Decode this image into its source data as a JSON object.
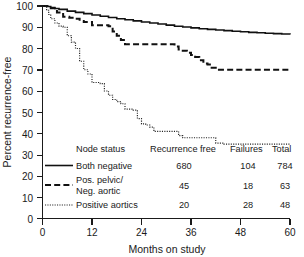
{
  "chart_data": {
    "type": "line",
    "title": "",
    "xlabel": "Months on study",
    "ylabel": "Percent recurrence-free",
    "xlim": [
      0,
      60
    ],
    "ylim": [
      0,
      100
    ],
    "xticks": [
      "0",
      "12",
      "24",
      "36",
      "48",
      "60"
    ],
    "yticks": [
      "0",
      "10",
      "20",
      "30",
      "40",
      "50",
      "60",
      "70",
      "80",
      "90",
      "100"
    ],
    "grid": false,
    "legend_position": "inside-lower-center",
    "series": [
      {
        "name": "Both negative",
        "style": "solid",
        "x": [
          0,
          1,
          2,
          3,
          4,
          6,
          8,
          10,
          12,
          14,
          16,
          18,
          20,
          22,
          24,
          26,
          28,
          30,
          32,
          34,
          36,
          38,
          40,
          42,
          44,
          46,
          48,
          50,
          52,
          54,
          56,
          58,
          60
        ],
        "y": [
          100,
          99.8,
          99.3,
          98.8,
          98.4,
          97.6,
          97.0,
          96.4,
          95.8,
          95.2,
          94.6,
          94.0,
          93.5,
          93.0,
          92.5,
          92.0,
          91.5,
          91.0,
          90.5,
          90.1,
          89.7,
          89.3,
          89.0,
          88.7,
          88.4,
          88.1,
          87.9,
          87.6,
          87.4,
          87.2,
          87.0,
          86.8,
          86.6
        ]
      },
      {
        "name": "Pos. pelvic/ Neg. aortic",
        "style": "dashed",
        "x": [
          0,
          1,
          2,
          3.5,
          5,
          6.5,
          8,
          9,
          10,
          12,
          14,
          16,
          17,
          18,
          19,
          20,
          22,
          24,
          30,
          32,
          33,
          34,
          35,
          36,
          37,
          38,
          39,
          40,
          41,
          42,
          60
        ],
        "y": [
          100,
          100,
          99,
          97,
          95,
          94.5,
          94,
          93,
          92.5,
          91,
          91,
          90.5,
          88,
          86,
          84,
          82,
          82,
          82,
          82,
          81,
          79.5,
          79,
          78,
          77,
          76,
          74.5,
          73,
          72.5,
          71,
          70,
          70
        ]
      },
      {
        "name": "Positive aortics",
        "style": "dotted",
        "x": [
          0,
          1,
          1.5,
          2,
          3,
          4,
          5,
          6,
          7,
          8,
          9,
          10,
          11,
          12,
          14,
          15,
          16,
          17,
          18,
          19,
          20,
          22,
          23,
          24,
          25,
          26,
          27,
          32,
          33,
          34,
          40,
          42,
          44,
          60
        ],
        "y": [
          100,
          98,
          96,
          94,
          92,
          90.5,
          90,
          86,
          83,
          80,
          74,
          70,
          68,
          64,
          63.5,
          60,
          58,
          56,
          55,
          54,
          51.5,
          51,
          47,
          44.5,
          44,
          43,
          41,
          41,
          39,
          38,
          38,
          35.5,
          35,
          35
        ]
      }
    ]
  },
  "axis": {
    "y_title": "Percent recurrence-free",
    "x_title": "Months on study",
    "y_tick_100": "100",
    "y_tick_90": "90",
    "y_tick_80": "80",
    "y_tick_70": "70",
    "y_tick_60": "60",
    "y_tick_50": "50",
    "y_tick_40": "40",
    "y_tick_30": "30",
    "y_tick_20": "20",
    "y_tick_10": "10",
    "y_tick_0": "0",
    "x_tick_0": "0",
    "x_tick_12": "12",
    "x_tick_24": "24",
    "x_tick_36": "36",
    "x_tick_48": "48",
    "x_tick_60": "60"
  },
  "legend": {
    "headers": {
      "node_status": "Node status",
      "recurrence_free": "Recurrence free",
      "failures": "Failures",
      "total": "Total"
    },
    "rows": [
      {
        "label": "Both negative",
        "label_line2": "",
        "recurrence_free": "680",
        "failures": "104",
        "total": "784",
        "style": "solid"
      },
      {
        "label": "Pos. pelvic/",
        "label_line2": "Neg. aortic",
        "recurrence_free": "45",
        "failures": "18",
        "total": "63",
        "style": "dashed"
      },
      {
        "label": "Positive aortics",
        "label_line2": "",
        "recurrence_free": "20",
        "failures": "28",
        "total": "48",
        "style": "dotted"
      }
    ]
  },
  "colors": {
    "ink": "#1a1a1a",
    "background": "#ffffff"
  }
}
